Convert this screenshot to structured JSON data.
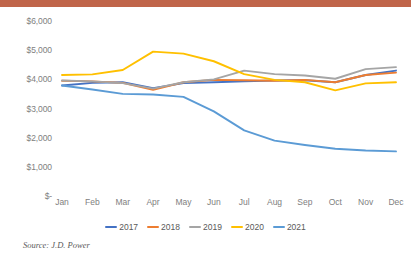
{
  "banner": {
    "color": "#c0654a"
  },
  "source": {
    "text": "Source: J.D. Power"
  },
  "axis": {
    "y_ticks": [
      "$6,000",
      "$5,000",
      "$4,000",
      "$3,000",
      "$2,000",
      "$1,000",
      "$-"
    ],
    "x_ticks": [
      "Jan",
      "Feb",
      "Mar",
      "Apr",
      "May",
      "Jun",
      "Jul",
      "Aug",
      "Sep",
      "Oct",
      "Nov",
      "Dec"
    ]
  },
  "legend": {
    "items": [
      {
        "label": "2017",
        "color": "#4472c4"
      },
      {
        "label": "2018",
        "color": "#ed7d31"
      },
      {
        "label": "2019",
        "color": "#a5a5a5"
      },
      {
        "label": "2020",
        "color": "#ffc000"
      },
      {
        "label": "2021",
        "color": "#5b9bd5"
      }
    ]
  },
  "chart_data": {
    "type": "line",
    "title": "",
    "xlabel": "",
    "ylabel": "",
    "ylim": [
      0,
      6000
    ],
    "ytick_values": [
      6000,
      5000,
      4000,
      3000,
      2000,
      1000,
      0
    ],
    "grid": false,
    "legend_position": "bottom",
    "categories": [
      "Jan",
      "Feb",
      "Mar",
      "Apr",
      "May",
      "Jun",
      "Jul",
      "Aug",
      "Sep",
      "Oct",
      "Nov",
      "Dec"
    ],
    "series": [
      {
        "name": "2017",
        "color": "#4472c4",
        "values": [
          3790,
          3880,
          3900,
          3700,
          3870,
          3900,
          3930,
          3960,
          3970,
          3900,
          4150,
          4300
        ]
      },
      {
        "name": "2018",
        "color": "#ed7d31",
        "values": [
          3950,
          3930,
          3880,
          3640,
          3900,
          3980,
          3970,
          3950,
          3980,
          3900,
          4150,
          4230
        ]
      },
      {
        "name": "2019",
        "color": "#a5a5a5",
        "values": [
          3960,
          3930,
          3870,
          3680,
          3900,
          4000,
          4300,
          4180,
          4130,
          4020,
          4350,
          4420
        ]
      },
      {
        "name": "2020",
        "color": "#ffc000",
        "values": [
          4150,
          4170,
          4320,
          4950,
          4880,
          4620,
          4180,
          3980,
          3900,
          3620,
          3860,
          3900
        ]
      },
      {
        "name": "2021",
        "color": "#5b9bd5",
        "values": [
          3790,
          3650,
          3500,
          3480,
          3400,
          2900,
          2250,
          1900,
          1750,
          1620,
          1560,
          1530
        ]
      }
    ]
  }
}
